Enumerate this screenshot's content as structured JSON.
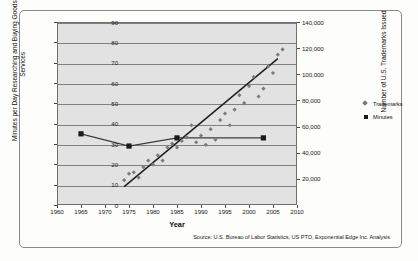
{
  "figure": {
    "source_note": "Source: U.S. Bureau of Labor Statistics, US PTO, Exponential Edge Inc. Analysis"
  },
  "legend": {
    "position": "right",
    "items": [
      {
        "label": "Trademarks",
        "marker": "diamond-icon",
        "color": "#7b7b7b"
      },
      {
        "label": "Minutes",
        "marker": "square-icon",
        "color": "#1a1a1a"
      }
    ]
  },
  "colors": {
    "plot_background": "#e2e2e2",
    "gridline": "#808080",
    "axis": "#6f6f6f",
    "trademarks_marker": "#7b7b7b",
    "minutes_marker": "#1a1a1a",
    "trendline": "#222222",
    "minutes_line": "#3b3b3b"
  },
  "chart_data": {
    "type": "scatter",
    "title": "",
    "subtitle": "",
    "xlabel": "Year",
    "ylabel": "Minutes per Day Researching and Buying Goods and Services",
    "y2label": "Number of U.S. Trademarks Issued",
    "xlim": [
      1960,
      2010
    ],
    "ylim": [
      0,
      90
    ],
    "y2lim": [
      0,
      140000
    ],
    "xticks": [
      1960,
      1965,
      1970,
      1975,
      1980,
      1985,
      1990,
      1995,
      2000,
      2005,
      2010
    ],
    "xticklabels": [
      "1960",
      "1965",
      "1970",
      "1975",
      "1980",
      "1985",
      "1990",
      "1995",
      "2000",
      "2005",
      "2010"
    ],
    "yticks": [
      0,
      10,
      20,
      30,
      40,
      50,
      60,
      70,
      80,
      90
    ],
    "yticklabels": [
      "0",
      "10",
      "20",
      "30",
      "40",
      "50",
      "60",
      "70",
      "80",
      "90"
    ],
    "y2ticks": [
      20000,
      40000,
      60000,
      80000,
      100000,
      120000,
      140000
    ],
    "y2ticklabels": [
      "20,000",
      "40,000",
      "60,000",
      "80,000",
      "100,000",
      "120,000",
      "140,000"
    ],
    "grid": true,
    "grid_axis": "y",
    "legend_position": "right",
    "series": [
      {
        "name": "Trademarks",
        "axis": "y2",
        "marker": "diamond",
        "color": "#7b7b7b",
        "unit": "trademarks issued",
        "points": [
          {
            "x": 1974,
            "y2": 19000
          },
          {
            "x": 1975,
            "y2": 24000
          },
          {
            "x": 1976,
            "y2": 25000
          },
          {
            "x": 1977,
            "y2": 21000
          },
          {
            "x": 1978,
            "y2": 29000
          },
          {
            "x": 1979,
            "y2": 34000
          },
          {
            "x": 1980,
            "y2": 31000
          },
          {
            "x": 1981,
            "y2": 38000
          },
          {
            "x": 1982,
            "y2": 34000
          },
          {
            "x": 1983,
            "y2": 44000
          },
          {
            "x": 1984,
            "y2": 47000
          },
          {
            "x": 1985,
            "y2": 44000
          },
          {
            "x": 1986,
            "y2": 49000
          },
          {
            "x": 1987,
            "y2": 52000
          },
          {
            "x": 1988,
            "y2": 61000
          },
          {
            "x": 1989,
            "y2": 48000
          },
          {
            "x": 1990,
            "y2": 53000
          },
          {
            "x": 1991,
            "y2": 46000
          },
          {
            "x": 1992,
            "y2": 58000
          },
          {
            "x": 1993,
            "y2": 50000
          },
          {
            "x": 1994,
            "y2": 65000
          },
          {
            "x": 1995,
            "y2": 70000
          },
          {
            "x": 1996,
            "y2": 61000
          },
          {
            "x": 1997,
            "y2": 73000
          },
          {
            "x": 1998,
            "y2": 84000
          },
          {
            "x": 1999,
            "y2": 78000
          },
          {
            "x": 2000,
            "y2": 91000
          },
          {
            "x": 2001,
            "y2": 98000
          },
          {
            "x": 2002,
            "y2": 83000
          },
          {
            "x": 2003,
            "y2": 89000
          },
          {
            "x": 2004,
            "y2": 106000
          },
          {
            "x": 2005,
            "y2": 101000
          },
          {
            "x": 2006,
            "y2": 115000
          },
          {
            "x": 2007,
            "y2": 119000
          }
        ]
      },
      {
        "name": "Minutes",
        "axis": "y",
        "marker": "square",
        "color": "#1a1a1a",
        "line": true,
        "unit": "minutes per day",
        "points": [
          {
            "x": 1965,
            "y": 35
          },
          {
            "x": 1975,
            "y": 29
          },
          {
            "x": 1985,
            "y": 33
          },
          {
            "x": 2003,
            "y": 33
          }
        ]
      }
    ],
    "annotations": [
      {
        "name": "trademarks-trendline",
        "type": "linear-trend",
        "series": "Trademarks",
        "x_start": 1974,
        "y2_start": 14000,
        "x_end": 2006,
        "y2_end": 112000
      }
    ]
  }
}
